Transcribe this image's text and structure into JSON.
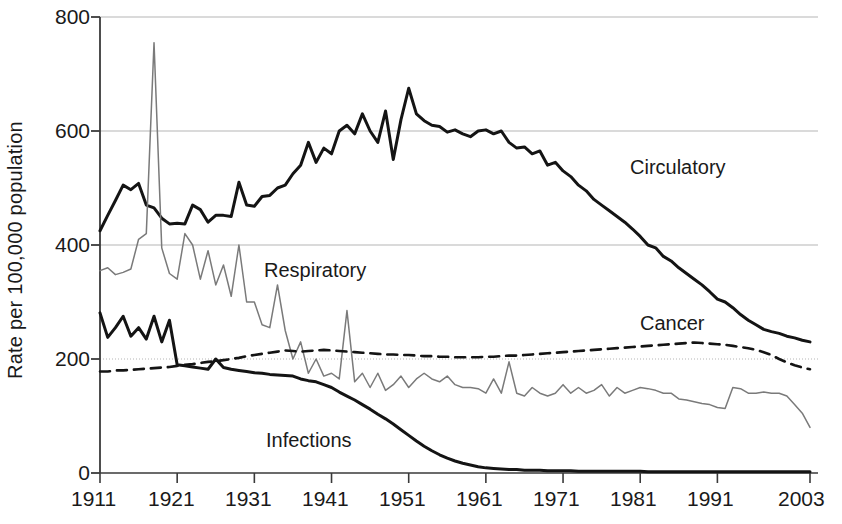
{
  "chart_data": {
    "type": "line",
    "title": "",
    "subtitle": "",
    "xlabel": "",
    "ylabel": "Rate per 100,000 population",
    "xlim": [
      1911,
      2003
    ],
    "ylim": [
      0,
      800
    ],
    "yticks": [
      0,
      200,
      400,
      600,
      800
    ],
    "xticks": [
      1911,
      1921,
      1931,
      1941,
      1951,
      1961,
      1971,
      1981,
      1991,
      2003
    ],
    "grid": "horizontal gridlines at 200 (dotted), 400, 600, 800 (solid light grey)",
    "legend": "inline series labels placed next to each curve",
    "annotations": [
      {
        "text": "Circulatory",
        "x": 1979,
        "y": 520
      },
      {
        "text": "Respiratory",
        "x": 1932,
        "y": 320
      },
      {
        "text": "Cancer",
        "x": 1981,
        "y": 272
      },
      {
        "text": "Infections",
        "x": 1933,
        "y": 70
      }
    ],
    "x": [
      1911,
      1912,
      1913,
      1914,
      1915,
      1916,
      1917,
      1918,
      1919,
      1920,
      1921,
      1922,
      1923,
      1924,
      1925,
      1926,
      1927,
      1928,
      1929,
      1930,
      1931,
      1932,
      1933,
      1934,
      1935,
      1936,
      1937,
      1938,
      1939,
      1940,
      1941,
      1942,
      1943,
      1944,
      1945,
      1946,
      1947,
      1948,
      1949,
      1950,
      1951,
      1952,
      1953,
      1954,
      1955,
      1956,
      1957,
      1958,
      1959,
      1960,
      1961,
      1962,
      1963,
      1964,
      1965,
      1966,
      1967,
      1968,
      1969,
      1970,
      1971,
      1972,
      1973,
      1974,
      1975,
      1976,
      1977,
      1978,
      1979,
      1980,
      1981,
      1982,
      1983,
      1984,
      1985,
      1986,
      1987,
      1988,
      1989,
      1990,
      1991,
      1992,
      1993,
      1994,
      1995,
      1996,
      1997,
      1998,
      1999,
      2000,
      2001,
      2002,
      2003
    ],
    "series": [
      {
        "name": "Circulatory",
        "style": "solid thick black",
        "color": "#141414",
        "values": [
          425,
          452,
          478,
          505,
          497,
          508,
          470,
          465,
          447,
          437,
          438,
          437,
          470,
          462,
          440,
          452,
          452,
          450,
          510,
          470,
          468,
          485,
          487,
          500,
          505,
          525,
          540,
          580,
          545,
          570,
          560,
          600,
          610,
          595,
          630,
          600,
          580,
          635,
          550,
          620,
          675,
          630,
          618,
          610,
          608,
          598,
          602,
          595,
          590,
          600,
          602,
          595,
          600,
          580,
          570,
          572,
          560,
          565,
          540,
          545,
          530,
          520,
          505,
          495,
          480,
          470,
          460,
          450,
          440,
          428,
          415,
          400,
          395,
          380,
          372,
          360,
          350,
          340,
          330,
          318,
          305,
          300,
          290,
          278,
          268,
          260,
          252,
          248,
          245,
          240,
          237,
          233,
          230
        ]
      },
      {
        "name": "Respiratory",
        "style": "solid thin grey",
        "color": "#7a7a7a",
        "values": [
          355,
          360,
          348,
          352,
          358,
          410,
          420,
          755,
          395,
          350,
          340,
          420,
          400,
          340,
          390,
          330,
          365,
          310,
          400,
          300,
          300,
          260,
          255,
          330,
          250,
          200,
          230,
          175,
          200,
          170,
          175,
          165,
          285,
          160,
          175,
          150,
          175,
          145,
          155,
          170,
          150,
          165,
          175,
          165,
          160,
          170,
          155,
          150,
          150,
          148,
          140,
          165,
          140,
          195,
          140,
          135,
          150,
          140,
          135,
          140,
          155,
          140,
          150,
          140,
          145,
          155,
          135,
          150,
          140,
          145,
          150,
          148,
          145,
          140,
          140,
          130,
          128,
          125,
          122,
          120,
          115,
          113,
          150,
          148,
          140,
          140,
          142,
          140,
          140,
          135,
          120,
          105,
          80
        ]
      },
      {
        "name": "Cancer",
        "style": "dashed black",
        "color": "#141414",
        "values": [
          178,
          178,
          180,
          180,
          181,
          182,
          183,
          184,
          185,
          186,
          188,
          190,
          191,
          193,
          195,
          196,
          198,
          200,
          202,
          205,
          207,
          209,
          211,
          213,
          215,
          214,
          213,
          214,
          215,
          216,
          215,
          214,
          213,
          212,
          211,
          210,
          209,
          208,
          208,
          207,
          207,
          206,
          205,
          205,
          204,
          204,
          203,
          203,
          203,
          203,
          204,
          204,
          205,
          206,
          206,
          207,
          208,
          209,
          210,
          211,
          212,
          213,
          214,
          215,
          216,
          217,
          218,
          219,
          220,
          221,
          222,
          223,
          224,
          225,
          226,
          227,
          228,
          229,
          228,
          227,
          226,
          225,
          223,
          221,
          219,
          216,
          212,
          207,
          200,
          194,
          189,
          185,
          182
        ]
      },
      {
        "name": "Infections",
        "style": "solid thick black",
        "color": "#141414",
        "values": [
          281,
          238,
          255,
          275,
          240,
          255,
          235,
          275,
          230,
          268,
          190,
          188,
          186,
          184,
          182,
          200,
          185,
          182,
          180,
          178,
          176,
          175,
          173,
          172,
          171,
          170,
          165,
          162,
          160,
          155,
          150,
          142,
          135,
          128,
          120,
          112,
          103,
          95,
          86,
          76,
          66,
          56,
          47,
          39,
          32,
          26,
          21,
          17,
          14,
          11,
          9,
          8,
          7,
          6,
          6,
          5,
          5,
          5,
          4,
          4,
          4,
          4,
          3,
          3,
          3,
          3,
          3,
          3,
          3,
          3,
          3,
          2,
          2,
          2,
          2,
          2,
          2,
          2,
          2,
          2,
          2,
          2,
          2,
          2,
          2,
          2,
          2,
          2,
          2,
          2,
          2,
          2,
          2
        ]
      }
    ]
  },
  "axis": {
    "y_tick_texts": [
      "800",
      "600",
      "400",
      "200",
      "0"
    ],
    "x_tick_texts": [
      "1911",
      "1921",
      "1931",
      "1941",
      "1951",
      "1961",
      "1971",
      "1981",
      "1991",
      "2003"
    ],
    "ylabel_text": "Rate per 100,000 population"
  },
  "labels": {
    "circulatory": "Circulatory",
    "respiratory": "Respiratory",
    "cancer": "Cancer",
    "infections": "Infections"
  },
  "colors": {
    "circulatory": "#141414",
    "respiratory": "#7a7a7a",
    "cancer": "#141414",
    "infections": "#141414",
    "gridline": "#b5b5b5",
    "axis": "#3a3a3a",
    "text": "#1a1a1a"
  }
}
